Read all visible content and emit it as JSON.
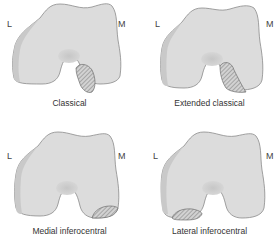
{
  "figure": {
    "panels": [
      {
        "caption": "Classical",
        "left_label": "L",
        "right_label": "M",
        "lesion": "classical"
      },
      {
        "caption": "Extended classical",
        "left_label": "L",
        "right_label": "M",
        "lesion": "extended-classical"
      },
      {
        "caption": "Medial inferocentral",
        "left_label": "L",
        "right_label": "M",
        "lesion": "medial-inferocentral"
      },
      {
        "caption": "Lateral inferocentral",
        "left_label": "L",
        "right_label": "M",
        "lesion": "lateral-inferocentral"
      }
    ],
    "colors": {
      "bone": "#dcdcdc",
      "bone_shadow": "#c9c9c9",
      "outline": "#8a8a8a",
      "notch": "#c4c4c4",
      "hatch": "#777777"
    }
  }
}
